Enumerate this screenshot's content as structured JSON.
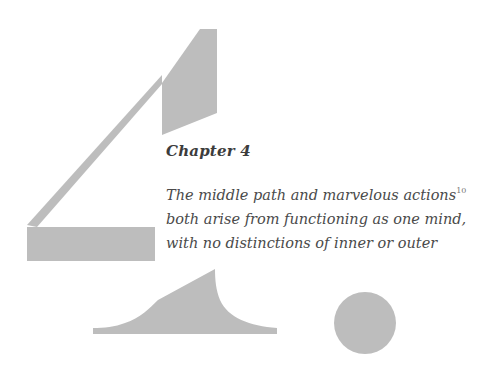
{
  "chapter": {
    "title": "Chapter 4",
    "numeral_decoration": "large-figure-4",
    "epigraph_lines": [
      "The middle path and marvelous actions",
      "both arise from functioning as one mind,",
      "with no distinctions of inner or outer"
    ],
    "footnote_marker": "10"
  },
  "colors": {
    "shape_fill": "#bdbdbd",
    "title_text": "#3c3c3c",
    "body_text": "#4a4a4a"
  }
}
